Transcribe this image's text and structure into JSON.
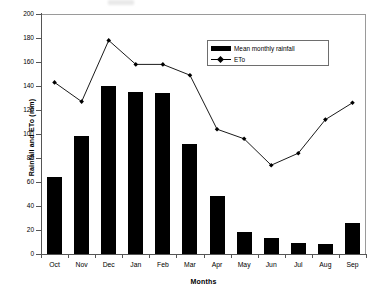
{
  "chart_data": {
    "type": "bar",
    "title": "",
    "xlabel": "Months",
    "ylabel": "Rainfall and ETo (mm)",
    "categories": [
      "Oct",
      "Nov",
      "Dec",
      "Jan",
      "Feb",
      "Mar",
      "Apr",
      "May",
      "Jun",
      "Jul",
      "Aug",
      "Sep"
    ],
    "ylim": [
      0,
      200
    ],
    "yticks": [
      0,
      20,
      40,
      60,
      80,
      100,
      120,
      140,
      160,
      180,
      200
    ],
    "grid": false,
    "legend_position": "inside-top-right",
    "series": [
      {
        "name": "Mean monthly rainfall",
        "type": "bar",
        "color": "#000000",
        "values": [
          64,
          98,
          140,
          135,
          134,
          92,
          48,
          18,
          13,
          9,
          8,
          26
        ]
      },
      {
        "name": "ETo",
        "type": "line",
        "color": "#000000",
        "marker": "diamond",
        "values": [
          143,
          127,
          178,
          158,
          158,
          149,
          104,
          96,
          74,
          84,
          112,
          126
        ]
      }
    ]
  },
  "axis": {
    "ytick_labels": [
      "0",
      "20",
      "40",
      "60",
      "80",
      "100",
      "120",
      "140",
      "160",
      "180",
      "200"
    ],
    "y_title": "Rainfall and ETo (mm)",
    "x_title": "Months"
  },
  "legend": {
    "entries": [
      {
        "label": "Mean monthly rainfall"
      },
      {
        "label": "ETo"
      }
    ]
  }
}
